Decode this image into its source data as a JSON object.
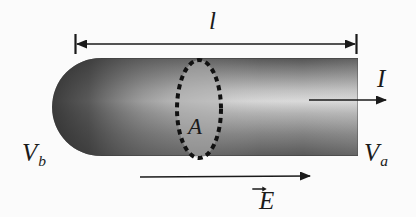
{
  "figure": {
    "background_color": "#fbfbfb",
    "ink_color": "#1a1a1a"
  },
  "labels": {
    "length": "l",
    "area": "A",
    "potential_b": "V",
    "potential_b_subscript": "b",
    "potential_a": "V",
    "potential_a_subscript": "a",
    "current": "I",
    "efield": "E"
  },
  "geometry": {
    "cylinder": {
      "left": 52,
      "right": 358,
      "top": 58,
      "bottom": 156,
      "cap_radius": 49,
      "gradient_light": "#e8e8e8",
      "gradient_mid": "#8f8f8f",
      "gradient_dark": "#3a3a3a"
    },
    "dimension_line": {
      "x_start": 75,
      "x_end": 356,
      "y": 44,
      "tick_height": 20
    },
    "cross_section_ellipse": {
      "cx": 199,
      "cy": 109,
      "rx": 22,
      "ry": 49,
      "dash": "5 4",
      "stroke_width": 4,
      "fill": "#b9b9b9"
    },
    "current_arrow": {
      "x_start": 309,
      "x_end": 387,
      "y": 100
    },
    "efield_arrow": {
      "x_start": 140,
      "x_end": 311,
      "y": 177
    }
  }
}
